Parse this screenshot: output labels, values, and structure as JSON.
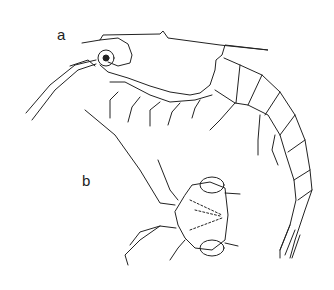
{
  "figure": {
    "labels": {
      "a": "a",
      "b": "b"
    },
    "colors": {
      "line": "#222222",
      "background": "#ffffff"
    }
  }
}
